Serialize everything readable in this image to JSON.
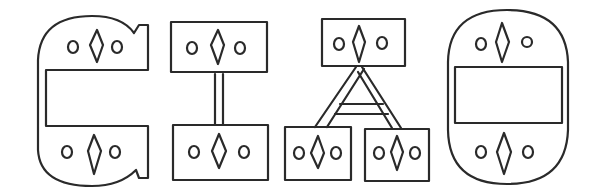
{
  "figure": {
    "colors": {
      "stroke": "#2a2a2a",
      "background": "#ffffff"
    },
    "glyphs": [
      {
        "name": "c-shaped-glyph",
        "motif": "circle-diamond-circle",
        "motif_count": 2
      },
      {
        "name": "two-panels-joined-by-stem",
        "motif": "circle-diamond-circle",
        "motif_count": 2
      },
      {
        "name": "three-panels-joined-by-ladder-triangle",
        "motif": "circle-diamond-circle",
        "motif_count": 3
      },
      {
        "name": "oval-with-central-rectangle",
        "motif": "circle-diamond-circle",
        "motif_count": 2
      }
    ]
  }
}
